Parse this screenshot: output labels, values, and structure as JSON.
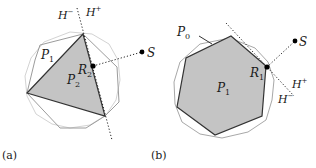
{
  "panels": [
    {
      "caption": "(a)",
      "labels": {
        "h_minus": "H",
        "h_minus_sup": "−",
        "h_plus": "H",
        "h_plus_sup": "+",
        "p1": "P",
        "p1_sub": "1",
        "p2": "P",
        "p2_sub": "2",
        "r2": "R",
        "r2_sub": "2",
        "s": "S"
      }
    },
    {
      "caption": "(b)",
      "labels": {
        "p0": "P",
        "p0_sub": "0",
        "p1": "P",
        "p1_sub": "1",
        "r1": "R",
        "r1_sub": "1",
        "s": "S",
        "h_plus": "H",
        "h_plus_sup": "+",
        "h_minus": "H",
        "h_minus_sup": "−"
      }
    }
  ],
  "colors": {
    "fill_gray": "#c4c4c4",
    "outline_dark": "#3a3a3a",
    "outline_light": "#a8a8a8",
    "outline_lighter": "#d0d0d0",
    "dot": "#000000"
  }
}
